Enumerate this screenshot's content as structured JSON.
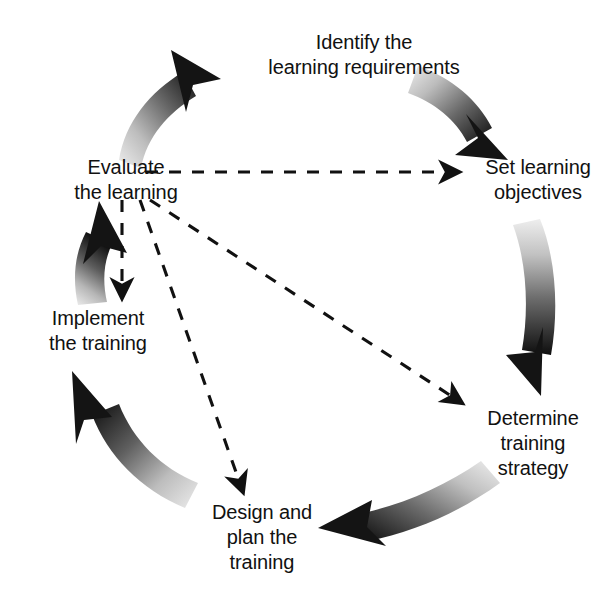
{
  "diagram": {
    "type": "cyclical-process-diagram",
    "background_color": "#ffffff",
    "text_color": "#111111",
    "nodes": [
      {
        "id": "identify",
        "label": "Identify the\nlearning requirements",
        "position": "top"
      },
      {
        "id": "set-objectives",
        "label": "Set learning\nobjectives",
        "position": "upper-right"
      },
      {
        "id": "determine",
        "label": "Determine\ntraining\nstrategy",
        "position": "lower-right"
      },
      {
        "id": "design",
        "label": "Design and\nplan the\ntraining",
        "position": "bottom"
      },
      {
        "id": "implement",
        "label": "Implement\nthe training",
        "position": "lower-left"
      },
      {
        "id": "evaluate",
        "label": "Evaluate\nthe learning",
        "position": "upper-left"
      }
    ],
    "cycle_arrows": [
      {
        "id": "evaluate-to-identify",
        "from": "evaluate",
        "to": "identify",
        "style": "thick-curved-gradient",
        "gradient_from": "#e8e8e8",
        "gradient_to": "#101010"
      },
      {
        "id": "identify-to-set-objectives",
        "from": "identify",
        "to": "set-objectives",
        "style": "thick-curved-gradient",
        "gradient_from": "#e8e8e8",
        "gradient_to": "#101010"
      },
      {
        "id": "set-objectives-to-determine",
        "from": "set-objectives",
        "to": "determine",
        "style": "thick-curved-gradient",
        "gradient_from": "#e8e8e8",
        "gradient_to": "#101010"
      },
      {
        "id": "determine-to-design",
        "from": "determine",
        "to": "design",
        "style": "thick-curved-gradient",
        "gradient_from": "#e8e8e8",
        "gradient_to": "#101010"
      },
      {
        "id": "design-to-implement",
        "from": "design",
        "to": "implement",
        "style": "thick-curved-gradient",
        "gradient_from": "#e8e8e8",
        "gradient_to": "#101010"
      },
      {
        "id": "implement-to-evaluate",
        "from": "implement",
        "to": "evaluate",
        "style": "thick-curved-gradient",
        "gradient_from": "#e8e8e8",
        "gradient_to": "#101010"
      }
    ],
    "feedback_arrows": [
      {
        "id": "evaluate-to-set-objectives",
        "from": "evaluate",
        "to": "set-objectives",
        "style": "dashed",
        "color": "#111111"
      },
      {
        "id": "evaluate-to-determine",
        "from": "evaluate",
        "to": "determine",
        "style": "dashed",
        "color": "#111111"
      },
      {
        "id": "evaluate-to-design",
        "from": "evaluate",
        "to": "design",
        "style": "dashed",
        "color": "#111111"
      },
      {
        "id": "evaluate-to-implement",
        "from": "evaluate",
        "to": "implement",
        "style": "dashed",
        "color": "#111111"
      }
    ]
  }
}
